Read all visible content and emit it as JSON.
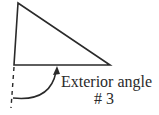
{
  "diagram": {
    "label_line1": "Exterior angle",
    "label_line2": "# 3",
    "stroke_color": "#2a2a2a",
    "triangle": {
      "top": [
        18,
        3
      ],
      "bottom_left": [
        14,
        65
      ],
      "right": [
        110,
        65
      ]
    },
    "extension_line": {
      "from": [
        14,
        66
      ],
      "to": [
        11,
        108
      ],
      "style": "dashed"
    },
    "arrow": {
      "from": [
        13,
        98
      ],
      "to": [
        56,
        68
      ],
      "head": "up"
    }
  }
}
